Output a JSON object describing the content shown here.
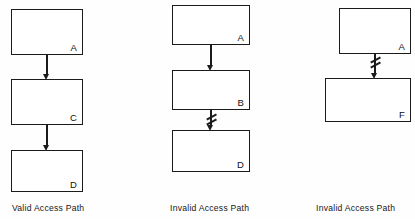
{
  "figure": {
    "type": "diagram",
    "title": "",
    "background_color": "#fefefe",
    "stroke_color": "#1b1b1b",
    "columns": [
      {
        "id": "left",
        "caption": "Valid Access Path",
        "nodes": [
          {
            "label": "A"
          },
          {
            "label": "C"
          },
          {
            "label": "D"
          }
        ],
        "edges": [
          {
            "from": "A",
            "to": "C",
            "blocked": false
          },
          {
            "from": "C",
            "to": "D",
            "blocked": false
          }
        ]
      },
      {
        "id": "middle",
        "caption": "Invalid Access Path",
        "nodes": [
          {
            "label": "A"
          },
          {
            "label": "B"
          },
          {
            "label": "D"
          }
        ],
        "edges": [
          {
            "from": "A",
            "to": "B",
            "blocked": false
          },
          {
            "from": "B",
            "to": "D",
            "blocked": true
          }
        ]
      },
      {
        "id": "right",
        "caption": "Invalid Access Path",
        "nodes": [
          {
            "label": "A"
          },
          {
            "label": "F"
          }
        ],
        "edges": [
          {
            "from": "A",
            "to": "F",
            "blocked": true
          }
        ]
      }
    ]
  }
}
